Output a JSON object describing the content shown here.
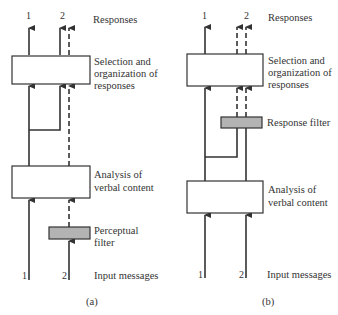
{
  "panels": [
    {
      "id": "a",
      "caption": "(a)",
      "responses_label": "Responses",
      "selection_label": [
        "Selection and",
        "organization of",
        "responses"
      ],
      "analysis_label": [
        "Analysis of",
        "verbal content"
      ],
      "filter_label": [
        "Perceptual",
        "filter"
      ],
      "input_label": "Input messages",
      "top_numbers": [
        "1",
        "2"
      ],
      "bottom_numbers": [
        "1",
        "2"
      ]
    },
    {
      "id": "b",
      "caption": "(b)",
      "responses_label": "Responses",
      "selection_label": [
        "Selection and",
        "organization of",
        "responses"
      ],
      "analysis_label": [
        "Analysis of",
        "verbal content"
      ],
      "filter_label": [
        "Response filter"
      ],
      "input_label": "Input messages",
      "top_numbers": [
        "1",
        "2"
      ],
      "bottom_numbers": [
        "1",
        "2"
      ]
    }
  ],
  "colors": {
    "line": "#333333",
    "filter_fill": "#b3b3b3",
    "box_fill": "#ffffff"
  }
}
